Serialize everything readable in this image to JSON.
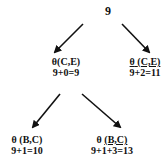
{
  "diagram": {
    "type": "search-tree",
    "root": {
      "value": "9"
    },
    "level1": [
      {
        "theta": "θ",
        "label_pre": "",
        "label_args": "(C,E)",
        "underlined": false,
        "calc": "9+0=9"
      },
      {
        "theta": "θ",
        "label_pre": " ",
        "label_args": "(C,E)",
        "underlined": true,
        "calc": "9+2=11"
      }
    ],
    "level2": [
      {
        "theta": "θ",
        "label_pre": " ",
        "label_args": "(B,C)",
        "underlined": false,
        "calc": "9+1=10"
      },
      {
        "theta": "θ",
        "label_pre": " ",
        "label_args": "(B,C)",
        "underlined": true,
        "calc": "9+1+3=13"
      }
    ],
    "edges": [
      {
        "from": "root",
        "to": "level1.0"
      },
      {
        "from": "root",
        "to": "level1.1"
      },
      {
        "from": "level1.0",
        "to": "level2.0"
      },
      {
        "from": "level1.0",
        "to": "level2.1"
      }
    ],
    "colors": {
      "ink": "#111111",
      "background": "#ffffff"
    }
  }
}
